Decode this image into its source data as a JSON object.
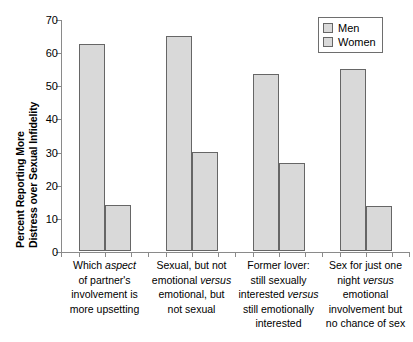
{
  "chart_data": {
    "type": "bar",
    "title": "",
    "xlabel": "",
    "ylabel_line1": "Percent Reporting More",
    "ylabel_line2": "Distress over Sexual Infidelity",
    "ylim": [
      0,
      70
    ],
    "yticks": [
      0,
      10,
      20,
      30,
      40,
      50,
      60,
      70
    ],
    "grid": false,
    "legend_position": "top-right",
    "categories": [
      "Which aspect of partner's involvement is more upsetting",
      "Sexual, but not emotional versus emotional, but not sexual",
      "Former lover: still sexually interested versus still emotionally interested",
      "Sex for just one night versus emotional involvement but no chance of sex"
    ],
    "series": [
      {
        "name": "Men",
        "values": [
          62.5,
          65.0,
          53.5,
          55.0
        ]
      },
      {
        "name": "Women",
        "values": [
          14.0,
          30.0,
          26.5,
          13.5
        ]
      }
    ]
  },
  "legend": {
    "items": [
      {
        "label": "Men"
      },
      {
        "label": "Women"
      }
    ]
  },
  "axis": {
    "tick_labels": [
      "0",
      "10",
      "20",
      "30",
      "40",
      "50",
      "60",
      "70"
    ]
  },
  "category_labels": [
    {
      "lines": [
        [
          {
            "t": "Which ",
            "i": false
          },
          {
            "t": "aspect",
            "i": true
          }
        ],
        [
          {
            "t": "of partner's",
            "i": false
          }
        ],
        [
          {
            "t": "involvement is",
            "i": false
          }
        ],
        [
          {
            "t": "more upsetting",
            "i": false
          }
        ]
      ]
    },
    {
      "lines": [
        [
          {
            "t": "Sexual, but not",
            "i": false
          }
        ],
        [
          {
            "t": "emotional ",
            "i": false
          },
          {
            "t": "versus",
            "i": true
          }
        ],
        [
          {
            "t": "emotional, but",
            "i": false
          }
        ],
        [
          {
            "t": "not sexual",
            "i": false
          }
        ]
      ]
    },
    {
      "lines": [
        [
          {
            "t": "Former lover:",
            "i": false
          }
        ],
        [
          {
            "t": "still sexually",
            "i": false
          }
        ],
        [
          {
            "t": "interested ",
            "i": false
          },
          {
            "t": "versus",
            "i": true
          }
        ],
        [
          {
            "t": "still emotionally",
            "i": false
          }
        ],
        [
          {
            "t": "interested",
            "i": false
          }
        ]
      ]
    },
    {
      "lines": [
        [
          {
            "t": "Sex for just one",
            "i": false
          }
        ],
        [
          {
            "t": "night ",
            "i": false
          },
          {
            "t": "versus",
            "i": true
          }
        ],
        [
          {
            "t": "emotional",
            "i": false
          }
        ],
        [
          {
            "t": "involvement but",
            "i": false
          }
        ],
        [
          {
            "t": "no chance of sex",
            "i": false
          }
        ]
      ]
    }
  ],
  "colors": {
    "bar_fill": "#d9d9d9",
    "bar_border": "#666666",
    "axis": "#8a8a8a",
    "text": "#000000"
  }
}
